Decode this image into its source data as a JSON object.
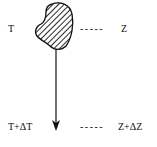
{
  "diagram": {
    "top_left_label": "T",
    "top_right_label": "Z",
    "bottom_left_label": "T+ΔT",
    "bottom_right_label": "Z+ΔZ",
    "dash": "- - - - -",
    "colors": {
      "stroke": "#111111",
      "background": "#ffffff"
    }
  }
}
